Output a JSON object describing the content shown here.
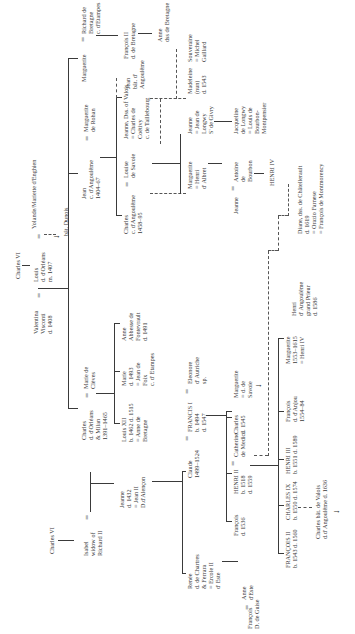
{
  "diagram": {
    "orientation": "rotated -90deg (text reads bottom-to-top)",
    "nodes": {
      "charles_vi_root": "Charles VI",
      "valentina": "Valentina\nVisconti\nd. 1408",
      "louis": "Louis\nd. d'Orléans\nm. 1407",
      "yolande": "Yolande/Mariette d'Enghien",
      "bat_dunois": "bât. Dunois",
      "charles_vi_left": "Charles VI",
      "isabel": "Isabel\nwidow of\nRichard II",
      "charles_orleans": "Charles\nd. d'Orléans\n& Milan\n1391–1465",
      "marie_cleves": "Marie de\nClèves",
      "jean_angouleme": "Jean\nc. d'Angoulême\n1404–67",
      "marguerite_rohan": "Marguerite\nde Rohan",
      "marguerite": "Marguerite",
      "richard_bretagne": "Richard de\nBretagne\nc. d'Etampes",
      "francois_ii_bretagne": "François II\nd. de Bretagne",
      "anne_bretagne_top": "Anne\ndss de Bretagne",
      "jeanne_1432": "Jeanne\nd. 1432\n= Jean II\nD.d'Alençon",
      "louis_xii": "Louis XII\nb. 1462 d. 1515\n= Anne de\nBretagne",
      "marie_1493": "Marie\nd. 1493\n= Jean de\nFoix\nc. d' Etampes",
      "anne_fontevrault": "Anne\nAbbesse de\nFontevrault\nd. 1491",
      "charles_angouleme": "Charles\nc. d'Angoulême\n1458–95",
      "louise_savoie": "Louise\nde Savoie",
      "jeanne_valois": "Jeanne, Dss. of Valois\n= Charles de\nCoëtivy\nc. de Taillebourg",
      "jean_bat": "Jean\nbât. d'\nAngoulême",
      "renee": "Renée\nd. de Chartres\n& Ferrara\n= Ercole II\nd' Este",
      "claude": "Claude\n1499–1524",
      "francis_i": "FRANCIS I\nb. 1494\nd. 1547",
      "eleonore": "Eleonore\nd' Autriche\nsp.",
      "marguerite_albret": "Marguerite\n= Henri\nd' Albret",
      "jeanne_longwy": "Jeanne\n= Jean de\nLongwy\nS' de Givry",
      "madeleine": "Madeleine\n(nun)\nd. 1543",
      "souveraine": "Souveraine\n= Michel\nGaillard",
      "francois_guise": "François\nD. de Guise",
      "anne_este": "Anne\nd'Este",
      "francois_1536": "François\nd. 1536",
      "henri_ii": "HENRI II\nb. 1518\nd. 1559",
      "catherine": "Catherine\nde Medici",
      "charles_1545": "Charles\nd. 1545",
      "marguerite_savoie": "Marguerite\n= d. de\nSavoie",
      "jeanne_antoine": "Jeanne",
      "antoine": "Antoine\nde\nBourbon",
      "henri_iv": "HENRI IV",
      "jacqueline": "Jacqueline\nde Longwy\n= Louis de\nBourbon-\nMontpensier",
      "francois_ii": "FRANÇOIS II\nb. 1543 d. 1560",
      "charles_ix": "CHARLES IX\nb. 1550 d. 1574",
      "henri_iii": "HENRI III\nb. 1551 d. 1589",
      "francois_anjou": "François\nd. d'Anjou\n1554–84",
      "marguerite_henri_iv": "Marguerite\n1553–1615\n= Henri IV",
      "henri_angouleme": "Henri\nd' Angoulême\ngrand Prieur\nd. 1586",
      "diane": "Diane, dss. de Châtellerault\nd. 1619\n= Orazio Farnese\n= François de Montmorency",
      "charles_bat": "Charles bât. de Valois\nd.d' Angoulême d. 1636"
    },
    "symbols": {
      "marriage": "=",
      "down_arrow": "↓"
    }
  }
}
